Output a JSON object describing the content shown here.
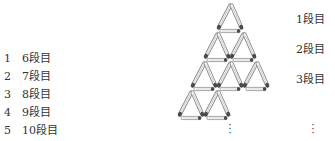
{
  "choices": [
    {
      "num": "1",
      "label": "6段目"
    },
    {
      "num": "2",
      "label": "7段目"
    },
    {
      "num": "3",
      "label": "8段目"
    },
    {
      "num": "4",
      "label": "9段目"
    },
    {
      "num": "5",
      "label": "10段目"
    }
  ],
  "row_labels": [
    "1段目",
    "2段目",
    "3段目"
  ],
  "ellipsis": "⋮",
  "figure": {
    "rows_shown": 4,
    "stick_color": "#888888",
    "head_color": "#444444"
  }
}
